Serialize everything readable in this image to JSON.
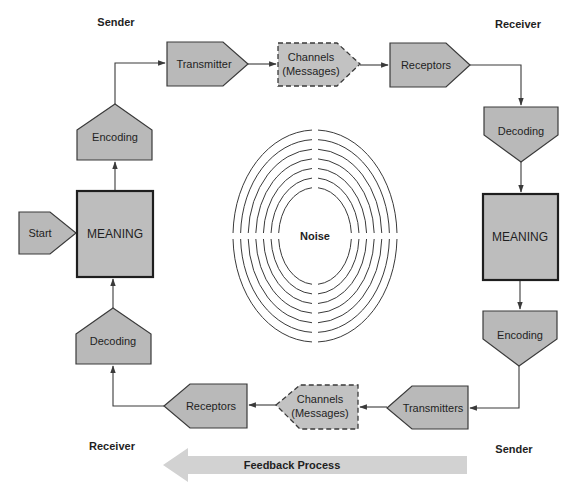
{
  "labels": {
    "sender_top": "Sender",
    "receiver_top": "Receiver",
    "receiver_bottom": "Receiver",
    "sender_bottom": "Sender"
  },
  "nodes": {
    "start": "Start",
    "meaning_left": "MEANING",
    "encoding_left": "Encoding",
    "transmitter_top": "Transmitter",
    "channels_top_line1": "Channels",
    "channels_top_line2": "(Messages)",
    "receptors_top": "Receptors",
    "decoding_right": "Decoding",
    "meaning_right": "MEANING",
    "encoding_right": "Encoding",
    "transmitters_bottom": "Transmitters",
    "channels_bottom_line1": "Channels",
    "channels_bottom_line2": "(Messages)",
    "receptors_bottom": "Receptors",
    "decoding_left": "Decoding"
  },
  "noise": {
    "label": "Noise",
    "ring_count": 7
  },
  "feedback": {
    "label": "Feedback Process",
    "direction": "left"
  },
  "colors": {
    "shape_fill": "#b9b9b9",
    "stroke": "#3a3a3a",
    "feedback_fill": "#d2d2d2"
  }
}
